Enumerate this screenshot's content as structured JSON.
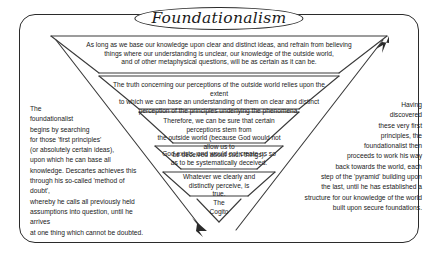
{
  "diagram": {
    "title": "Foundationalism",
    "type": "inverted-pyramid",
    "bands": [
      {
        "id": "band-1",
        "text": "As long as we base our knowledge upon clear and distinct ideas, and refrain from believing\nthings where our understanding is unclear, our knowledge of the outside world,\nand of other metaphysical questions, will be as certain as it can be."
      },
      {
        "id": "band-2",
        "text": "The truth concerning our perceptions of the outside world relies upon the extent\nto which we can base an understanding of them on clear and distinct\nperception of the principles underlying the phenomena."
      },
      {
        "id": "band-3",
        "text": "Therefore, we can be sure that certain perceptions stem from\nthe outside world (because God would not allow us to\nbe deceived about such things)."
      },
      {
        "id": "band-4",
        "text": "God exists, and would not create us so\nas to be systematically deceived."
      },
      {
        "id": "band-5",
        "text": "Whatever we clearly and\ndistinctly perceive, is\ntrue."
      }
    ],
    "apex": {
      "id": "apex-cogito",
      "text": "The\nCogito"
    },
    "left_note": "The\nfoundationalist\nbegins by searching\nfor those 'first principles'\n(or absolutely certain ideas),\nupon which he can base all\nknowledge. Descartes achieves this\nthrough his so-called 'method of doubt',\nwhereby he calls all previously held\nassumptions into question, until he arrives\nat one thing which cannot be doubted.",
    "right_note": "Having\ndiscovered\nthese very first\nprinciples, the\nfoundationalist then\nproceeds to work his way\nback towards the world, each\nstep of the 'pyramid' building upon\nthe last, until he has established a\nstructure for our knowledge of the world\nbuilt upon secure foundations.",
    "arrows": [
      {
        "id": "arrow-down-to-cogito",
        "direction": "down-right",
        "meaning": "method of doubt descending to the Cogito"
      },
      {
        "id": "arrow-up-from-cogito",
        "direction": "up-right",
        "meaning": "rebuilding knowledge upward from first principles"
      }
    ],
    "colors": {
      "ink": "#2b2b2b",
      "background": "#ffffff",
      "line": "#3a3a3a"
    }
  }
}
